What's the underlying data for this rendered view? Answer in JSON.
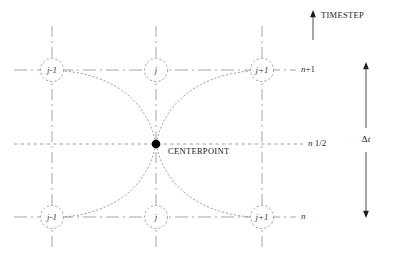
{
  "diagram": {
    "colors": {
      "grid_line": "#9a9a9a",
      "node_circle": "#8f8f8f",
      "curve": "#8a8a8a",
      "center_dot": "#000000",
      "text": "#1e1e1e",
      "background": "#ffffff"
    },
    "center": {
      "label": "CENTERPOINT",
      "x": 156,
      "y": 144
    },
    "axis_annotations": {
      "timestep": {
        "label": "TIMESTEP",
        "arrow": "up-arrow-icon"
      },
      "delta_t": {
        "symbol": "Δ",
        "variable": "t",
        "arrow": "double-headed-vertical-arrow-icon"
      }
    },
    "rows": [
      {
        "id": "top",
        "label_plain": "n",
        "label_sup": "+1",
        "y": 70,
        "style": "dash-dot"
      },
      {
        "id": "middle",
        "label_plain": "n",
        "label_sup": " 1/2",
        "y": 144,
        "style": "dotted"
      },
      {
        "id": "bottom",
        "label_plain": "n",
        "label_sup": "",
        "y": 217,
        "style": "dash-dot"
      }
    ],
    "columns": [
      {
        "id": "left",
        "label": "j-1",
        "x": 52
      },
      {
        "id": "center",
        "label": "j",
        "x": 156
      },
      {
        "id": "right",
        "label": "j+1",
        "x": 262
      }
    ],
    "nodes": [
      {
        "name": "node-top-left",
        "label": "j-1",
        "x": 52,
        "y": 70,
        "row": "n+1"
      },
      {
        "name": "node-top-center",
        "label": "j",
        "x": 156,
        "y": 70,
        "row": "n+1"
      },
      {
        "name": "node-top-right",
        "label": "j+1",
        "x": 262,
        "y": 70,
        "row": "n+1"
      },
      {
        "name": "node-bottom-left",
        "label": "j-1",
        "x": 52,
        "y": 217,
        "row": "n"
      },
      {
        "name": "node-bottom-center",
        "label": "j",
        "x": 156,
        "y": 217,
        "row": "n"
      },
      {
        "name": "node-bottom-right",
        "label": "j+1",
        "x": 262,
        "y": 217,
        "row": "n"
      }
    ],
    "curves": [
      {
        "name": "curve-center-to-top-left",
        "from": "centerpoint",
        "to": "node-top-left"
      },
      {
        "name": "curve-center-to-top-right",
        "from": "centerpoint",
        "to": "node-top-right"
      },
      {
        "name": "curve-center-to-bottom-left",
        "from": "centerpoint",
        "to": "node-bottom-left"
      },
      {
        "name": "curve-center-to-bottom-right",
        "from": "centerpoint",
        "to": "node-bottom-right"
      }
    ]
  }
}
